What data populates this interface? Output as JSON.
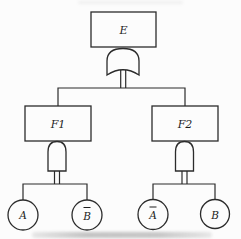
{
  "diagram": {
    "type": "fault-tree",
    "top_event": {
      "id": "E",
      "label": "E",
      "gate": "OR",
      "children": [
        "F1",
        "F2"
      ]
    },
    "intermediate_events": [
      {
        "id": "F1",
        "label": "F1",
        "gate": "AND",
        "children": [
          "A",
          "B-bar"
        ]
      },
      {
        "id": "F2",
        "label": "F2",
        "gate": "AND",
        "children": [
          "A-bar",
          "B"
        ]
      }
    ],
    "basic_events": [
      {
        "id": "A",
        "label": "A",
        "negated": false
      },
      {
        "id": "B-bar",
        "label": "B",
        "negated": true
      },
      {
        "id": "A-bar",
        "label": "A",
        "negated": true
      },
      {
        "id": "B",
        "label": "B",
        "negated": false
      }
    ],
    "colors": {
      "line": "#2b2b2b",
      "background": "#fcfcfc",
      "text": "#1c1c1c"
    }
  }
}
